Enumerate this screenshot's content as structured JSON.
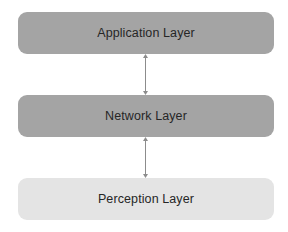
{
  "diagram": {
    "type": "layered-architecture",
    "layers": [
      {
        "label": "Application Layer",
        "fill": "#a4a4a4"
      },
      {
        "label": "Network Layer",
        "fill": "#a4a4a4"
      },
      {
        "label": "Perception Layer",
        "fill": "#e4e4e4"
      }
    ],
    "connectors": [
      {
        "from": "Application Layer",
        "to": "Network Layer",
        "style": "double-headed-arrow",
        "color": "#8c8c8c"
      },
      {
        "from": "Network Layer",
        "to": "Perception Layer",
        "style": "double-headed-arrow",
        "color": "#8c8c8c"
      }
    ],
    "text_color": "#262626"
  }
}
